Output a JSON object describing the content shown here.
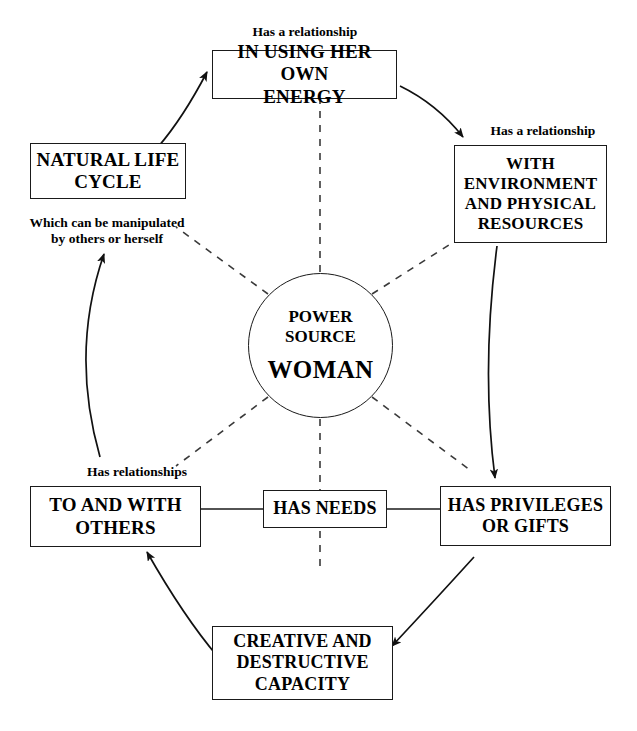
{
  "diagram": {
    "title_center": {
      "heading": "POWER\nSOURCE",
      "subject": "WOMAN"
    },
    "nodes": {
      "energy": "IN USING HER OWN\nENERGY",
      "environment": "WITH\nENVIRONMENT\nAND PHYSICAL\nRESOURCES",
      "natural_life_cycle": "NATURAL LIFE\nCYCLE",
      "to_and_with_others": "TO AND WITH\nOTHERS",
      "has_needs": "HAS NEEDS",
      "has_privileges": "HAS PRIVILEGES\nOR GIFTS",
      "creative_destructive": "CREATIVE AND\nDESTRUCTIVE\nCAPACITY"
    },
    "annotations": {
      "top": "Has a relationship",
      "right": "Has a relationship",
      "left": "Which can be manipulated\nby others or herself",
      "bottom_left": "Has relationships"
    },
    "colors": {
      "stroke": "#1a1a1a",
      "text": "#000000",
      "background": "#ffffff",
      "dashed_spoke": "#3a3a3a"
    }
  }
}
